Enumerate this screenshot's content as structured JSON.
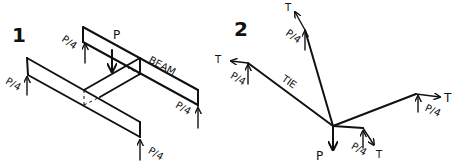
{
  "figure_1": {
    "number": "1",
    "load_label": "P",
    "beam_label": "BEAM",
    "reactions": [
      "P/4",
      "P/4",
      "P/4",
      "P/4"
    ]
  },
  "figure_2": {
    "number": "2",
    "load_label": "P",
    "tie_label": "TIE",
    "tension_labels": [
      "T",
      "T",
      "T",
      "T"
    ],
    "reactions": [
      "P/4",
      "P/4",
      "P/4",
      "P/4"
    ]
  },
  "colors": {
    "ink": "#111111",
    "background": "#ffffff"
  }
}
